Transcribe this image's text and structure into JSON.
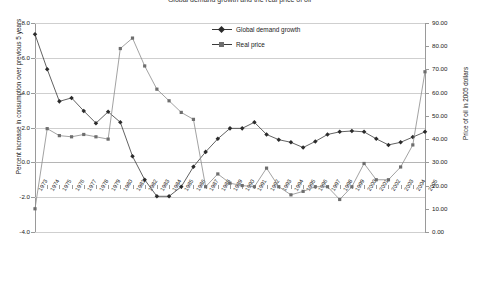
{
  "chart_data": {
    "type": "line",
    "title": "Global demand growth and the real price of oil",
    "categories": [
      "1973",
      "1974",
      "1975",
      "1976",
      "1977",
      "1978",
      "1979",
      "1980",
      "1981",
      "1982",
      "1983",
      "1984",
      "1985",
      "1986",
      "1987",
      "1988",
      "1989",
      "1990",
      "1991",
      "1992",
      "1993",
      "1994",
      "1995",
      "1996",
      "1997",
      "1998",
      "1999",
      "2000",
      "2001",
      "2002",
      "2003",
      "2004",
      "2005"
    ],
    "series": [
      {
        "name": "Global demand growth",
        "axis": "left",
        "marker": "diamond",
        "values": [
          7.35,
          5.35,
          3.5,
          3.7,
          2.95,
          2.25,
          2.9,
          2.3,
          0.35,
          -1.0,
          -1.95,
          -1.95,
          -1.4,
          -0.25,
          0.6,
          1.35,
          1.95,
          1.95,
          2.3,
          1.6,
          1.3,
          1.15,
          0.85,
          1.2,
          1.6,
          1.75,
          1.8,
          1.75,
          1.35,
          1.0,
          1.15,
          1.45,
          1.75
        ]
      },
      {
        "name": "Real price",
        "axis": "right",
        "marker": "square",
        "values": [
          10.0,
          44.5,
          41.5,
          41.0,
          42.0,
          41.0,
          40.0,
          79.0,
          83.5,
          71.5,
          61.5,
          56.5,
          51.5,
          48.5,
          19.5,
          25.0,
          21.0,
          20.0,
          19.5,
          27.5,
          19.5,
          16.0,
          17.5,
          19.5,
          19.5,
          14.0,
          19.5,
          29.5,
          22.5,
          22.5,
          28.0,
          37.5,
          69.0
        ]
      }
    ],
    "xlabel": "",
    "ylabel_left": "Percent increase in consumption over previous 5 years",
    "ylabel_right": "Price of oil in 2005 dollars",
    "ylim_left": [
      -4.0,
      8.0
    ],
    "ylim_right": [
      0.0,
      90.0
    ],
    "yticks_left": [
      "8.0",
      "6.0",
      "4.0",
      "2.0",
      "0.0",
      "-2.0",
      "-4.0"
    ],
    "yticks_right": [
      "90.00",
      "80.00",
      "70.00",
      "60.00",
      "50.00",
      "40.00",
      "30.00",
      "20.00",
      "10.00",
      "0.00"
    ],
    "grid": true,
    "legend_position": "top-center"
  },
  "legend": {
    "items": [
      {
        "label": "Global demand growth",
        "marker": "diamond-marker-icon"
      },
      {
        "label": "Real price",
        "marker": "square-marker-icon"
      }
    ]
  },
  "colors": {
    "demand_line": "#3a3a3a",
    "price_line": "#8a8a8a",
    "grid": "#cfcfcf",
    "axis": "#9a9a9a"
  }
}
